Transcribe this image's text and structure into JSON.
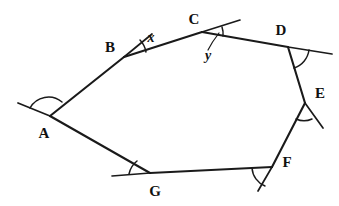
{
  "figure": {
    "shape_name": "heptagon",
    "side_count": 7,
    "background_color": "#ffffff",
    "stroke_color": "#1a1a1a"
  },
  "vertices": [
    {
      "id": "A",
      "label": "A",
      "x": 50,
      "y": 116,
      "label_x": 44,
      "label_y": 138
    },
    {
      "id": "B",
      "label": "B",
      "x": 124,
      "y": 57,
      "label_x": 110,
      "label_y": 52
    },
    {
      "id": "C",
      "label": "C",
      "x": 202,
      "y": 32,
      "label_x": 190,
      "label_y": 24
    },
    {
      "id": "D",
      "label": "D",
      "x": 288,
      "y": 47,
      "label_x": 277,
      "label_y": 35
    },
    {
      "id": "E",
      "label": "E",
      "x": 305,
      "y": 103,
      "label_x": 315,
      "label_y": 95
    },
    {
      "id": "F",
      "label": "F",
      "x": 272,
      "y": 167,
      "label_x": 284,
      "label_y": 166
    },
    {
      "id": "G",
      "label": "G",
      "x": 150,
      "y": 173,
      "label_x": 155,
      "label_y": 195
    }
  ],
  "sides": [
    {
      "from": "A",
      "to": "B"
    },
    {
      "from": "B",
      "to": "C"
    },
    {
      "from": "C",
      "to": "D"
    },
    {
      "from": "D",
      "to": "E"
    },
    {
      "from": "E",
      "to": "F"
    },
    {
      "from": "F",
      "to": "G"
    },
    {
      "from": "G",
      "to": "A"
    }
  ],
  "exterior_rays": [
    {
      "at": "A",
      "description": "ray extending up-left beyond A along GA produced"
    },
    {
      "at": "B",
      "description": "ray extending up-right beyond B"
    },
    {
      "at": "C",
      "description": "ray extending up-right beyond C along BC produced"
    },
    {
      "at": "D",
      "description": "ray extending right beyond D along CD produced"
    },
    {
      "at": "E",
      "description": "ray extending down-right beyond E along DE produced"
    },
    {
      "at": "F",
      "description": "ray extending down beyond F along EF produced"
    },
    {
      "at": "G",
      "description": "ray extending left beyond G along FG produced"
    }
  ],
  "angle_labels": [
    {
      "id": "x",
      "text": "x",
      "at_vertex": "B",
      "label_x": 149,
      "label_y": 41
    },
    {
      "id": "y",
      "text": "y",
      "at_vertex": "C",
      "label_x": 207,
      "label_y": 57
    }
  ],
  "angle_marks": [
    {
      "at": "A",
      "marked": true
    },
    {
      "at": "B",
      "marked": true
    },
    {
      "at": "C",
      "marked": true
    },
    {
      "at": "D",
      "marked": true
    },
    {
      "at": "E",
      "marked": true
    },
    {
      "at": "F",
      "marked": true
    },
    {
      "at": "G",
      "marked": true
    }
  ]
}
